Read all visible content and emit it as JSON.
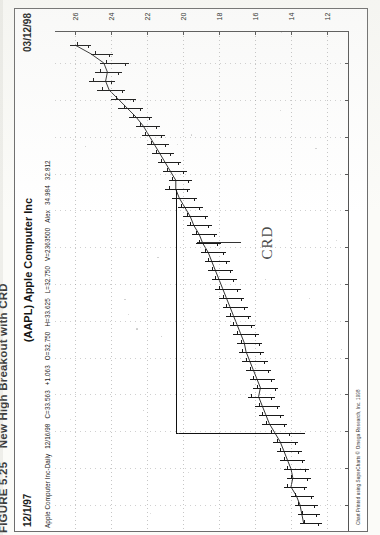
{
  "figure": {
    "number": "FIGURE 5.25",
    "title": "New High Breakout with CRD"
  },
  "header": {
    "date_left": "12/1/97",
    "security_title": "(AAPL) Apple Computer Inc",
    "date_right": "03/12/98"
  },
  "quote_line": {
    "name": "Apple Computer Inc-Daily",
    "date": "12/16/98",
    "close": "C=33.563",
    "change": "+1.063",
    "open": "O=32.750",
    "high": "H=33.625",
    "low": "L=32.750",
    "volume": "V=2363500",
    "indicator": "Alex",
    "indicator_hi": "34.984",
    "indicator_lo": "32.812"
  },
  "annotation": {
    "label": "CRD"
  },
  "copyright": "Chart Printed using SuperCharts © Omega Research, Inc. 1998",
  "chart_data": {
    "type": "line",
    "subtype": "ohlc-bar-rotated",
    "title": "(AAPL) Apple Computer Inc",
    "xlabel": "Date",
    "ylabel": "Price",
    "orientation": "rotated-90",
    "grid": true,
    "legend": "none",
    "price_axis": {
      "position": "top",
      "ticks": [
        26,
        24,
        22,
        20,
        18,
        16,
        14,
        12
      ],
      "range": [
        27,
        11
      ]
    },
    "date_axis": {
      "position": "right",
      "ticks": [
        "12",
        "9",
        "23",
        "20",
        "6",
        "16",
        "2",
        "24",
        "18",
        "9",
        "29",
        "22",
        "15"
      ],
      "range": [
        "12/1/97",
        "03/12/98"
      ]
    },
    "bars": [
      {
        "i": 0,
        "high": 26.3,
        "low": 25.1,
        "open": 25.9,
        "close": 25.3
      },
      {
        "i": 1,
        "high": 25.1,
        "low": 23.9,
        "open": 24.9,
        "close": 24.1
      },
      {
        "i": 2,
        "high": 24.6,
        "low": 23.0,
        "open": 24.3,
        "close": 23.2
      },
      {
        "i": 3,
        "high": 24.9,
        "low": 23.4,
        "open": 24.6,
        "close": 23.6
      },
      {
        "i": 4,
        "high": 25.2,
        "low": 23.8,
        "open": 25.0,
        "close": 24.0
      },
      {
        "i": 5,
        "high": 24.8,
        "low": 23.2,
        "open": 24.5,
        "close": 23.4
      },
      {
        "i": 6,
        "high": 24.0,
        "low": 22.6,
        "open": 23.7,
        "close": 22.8
      },
      {
        "i": 7,
        "high": 23.6,
        "low": 22.2,
        "open": 23.3,
        "close": 22.4
      },
      {
        "i": 8,
        "high": 23.0,
        "low": 21.7,
        "open": 22.8,
        "close": 21.9
      },
      {
        "i": 9,
        "high": 22.6,
        "low": 21.3,
        "open": 22.4,
        "close": 21.5
      },
      {
        "i": 10,
        "high": 22.3,
        "low": 21.0,
        "open": 22.1,
        "close": 21.2
      },
      {
        "i": 11,
        "high": 22.0,
        "low": 20.8,
        "open": 21.8,
        "close": 21.0
      },
      {
        "i": 12,
        "high": 21.7,
        "low": 20.5,
        "open": 21.5,
        "close": 20.7
      },
      {
        "i": 13,
        "high": 21.4,
        "low": 20.1,
        "open": 21.2,
        "close": 20.3
      },
      {
        "i": 14,
        "high": 21.1,
        "low": 19.8,
        "open": 20.9,
        "close": 20.0
      },
      {
        "i": 15,
        "high": 20.8,
        "low": 19.5,
        "open": 20.6,
        "close": 19.7
      },
      {
        "i": 16,
        "high": 21.0,
        "low": 19.6,
        "open": 20.8,
        "close": 19.8
      },
      {
        "i": 17,
        "high": 20.6,
        "low": 19.2,
        "open": 20.4,
        "close": 19.4
      },
      {
        "i": 18,
        "high": 20.3,
        "low": 18.9,
        "open": 20.1,
        "close": 19.1
      },
      {
        "i": 19,
        "high": 20.0,
        "low": 18.6,
        "open": 19.8,
        "close": 18.8
      },
      {
        "i": 20,
        "high": 19.8,
        "low": 18.4,
        "open": 19.6,
        "close": 18.6
      },
      {
        "i": 21,
        "high": 19.5,
        "low": 18.1,
        "open": 19.3,
        "close": 18.3
      },
      {
        "i": 22,
        "high": 19.3,
        "low": 17.9,
        "open": 19.1,
        "close": 18.1
      },
      {
        "i": 23,
        "high": 19.0,
        "low": 17.6,
        "open": 18.8,
        "close": 17.8
      },
      {
        "i": 24,
        "high": 18.8,
        "low": 17.4,
        "open": 18.6,
        "close": 17.6
      },
      {
        "i": 25,
        "high": 18.6,
        "low": 17.2,
        "open": 18.4,
        "close": 17.4
      },
      {
        "i": 26,
        "high": 18.4,
        "low": 17.0,
        "open": 18.2,
        "close": 17.2
      },
      {
        "i": 27,
        "high": 18.2,
        "low": 16.8,
        "open": 18.0,
        "close": 17.0
      },
      {
        "i": 28,
        "high": 18.0,
        "low": 16.6,
        "open": 17.8,
        "close": 16.8
      },
      {
        "i": 29,
        "high": 17.8,
        "low": 16.4,
        "open": 17.6,
        "close": 16.6
      },
      {
        "i": 30,
        "high": 17.6,
        "low": 16.2,
        "open": 17.4,
        "close": 16.4
      },
      {
        "i": 31,
        "high": 17.4,
        "low": 16.0,
        "open": 17.2,
        "close": 16.2
      },
      {
        "i": 32,
        "high": 17.2,
        "low": 15.8,
        "open": 17.0,
        "close": 16.0
      },
      {
        "i": 33,
        "high": 17.0,
        "low": 15.6,
        "open": 16.8,
        "close": 15.8
      },
      {
        "i": 34,
        "high": 16.9,
        "low": 15.5,
        "open": 16.7,
        "close": 15.7
      },
      {
        "i": 35,
        "high": 16.7,
        "low": 15.3,
        "open": 16.5,
        "close": 15.5
      },
      {
        "i": 36,
        "high": 16.5,
        "low": 15.1,
        "open": 16.3,
        "close": 15.3
      },
      {
        "i": 37,
        "high": 16.3,
        "low": 14.9,
        "open": 16.1,
        "close": 15.1
      },
      {
        "i": 38,
        "high": 16.1,
        "low": 14.7,
        "open": 15.9,
        "close": 14.9
      },
      {
        "i": 39,
        "high": 16.4,
        "low": 14.9,
        "open": 16.2,
        "close": 15.1
      },
      {
        "i": 40,
        "high": 16.0,
        "low": 14.6,
        "open": 15.8,
        "close": 14.8
      },
      {
        "i": 41,
        "high": 15.8,
        "low": 14.4,
        "open": 15.6,
        "close": 14.6
      },
      {
        "i": 42,
        "high": 15.6,
        "low": 14.2,
        "open": 15.4,
        "close": 14.4
      },
      {
        "i": 43,
        "high": 15.3,
        "low": 13.9,
        "open": 15.1,
        "close": 14.1
      },
      {
        "i": 44,
        "high": 15.0,
        "low": 13.6,
        "open": 14.8,
        "close": 13.8
      },
      {
        "i": 45,
        "high": 14.8,
        "low": 13.4,
        "open": 14.6,
        "close": 13.6
      },
      {
        "i": 46,
        "high": 14.6,
        "low": 13.2,
        "open": 14.4,
        "close": 13.4
      },
      {
        "i": 47,
        "high": 14.4,
        "low": 13.0,
        "open": 14.2,
        "close": 13.2
      },
      {
        "i": 48,
        "high": 14.2,
        "low": 12.9,
        "open": 14.0,
        "close": 13.1
      },
      {
        "i": 49,
        "high": 14.4,
        "low": 13.1,
        "open": 14.2,
        "close": 13.3
      },
      {
        "i": 50,
        "high": 14.0,
        "low": 12.7,
        "open": 13.8,
        "close": 12.9
      },
      {
        "i": 51,
        "high": 13.8,
        "low": 12.5,
        "open": 13.6,
        "close": 12.7
      },
      {
        "i": 52,
        "high": 13.6,
        "low": 12.4,
        "open": 13.4,
        "close": 12.6
      },
      {
        "i": 53,
        "high": 13.5,
        "low": 12.3,
        "open": 13.3,
        "close": 12.5
      }
    ],
    "breakout_level": 20.4,
    "moving_average": [
      26.0,
      25.1,
      24.4,
      24.2,
      24.3,
      24.1,
      23.6,
      23.1,
      22.6,
      22.2,
      21.9,
      21.6,
      21.3,
      21.0,
      20.7,
      20.4,
      20.4,
      20.2,
      19.9,
      19.6,
      19.4,
      19.1,
      18.9,
      18.6,
      18.4,
      18.2,
      18.0,
      17.8,
      17.6,
      17.4,
      17.2,
      17.0,
      16.8,
      16.6,
      16.5,
      16.3,
      16.1,
      15.9,
      15.7,
      15.8,
      15.6,
      15.4,
      15.2,
      14.9,
      14.6,
      14.4,
      14.2,
      14.0,
      13.9,
      14.0,
      13.7,
      13.5,
      13.4,
      13.3
    ]
  }
}
